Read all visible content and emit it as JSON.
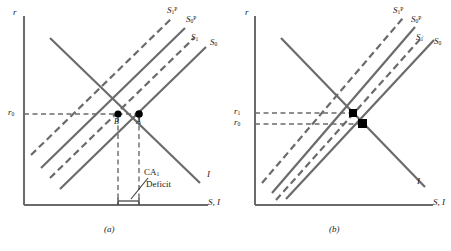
{
  "figure": {
    "type": "economics-diagram"
  },
  "panels": [
    {
      "id": "a",
      "caption": "(a)",
      "axes": {
        "y_label": "r",
        "x_label": "S, I"
      },
      "y_ticks": [
        {
          "label": "r",
          "sub": "0"
        }
      ],
      "curves": [
        {
          "name": "S1P",
          "label_base": "S",
          "label_sub": "1",
          "label_sup": "P",
          "style": "dashed",
          "slope": "up"
        },
        {
          "name": "S0P",
          "label_base": "S",
          "label_sub": "0",
          "label_sup": "P",
          "style": "solid",
          "slope": "up"
        },
        {
          "name": "S1",
          "label_base": "S",
          "label_sub": "1",
          "label_sup": "",
          "style": "dashed",
          "slope": "up"
        },
        {
          "name": "S0",
          "label_base": "S",
          "label_sub": "0",
          "label_sup": "",
          "style": "solid",
          "slope": "up"
        },
        {
          "name": "I",
          "label_base": "I",
          "label_sub": "",
          "label_sup": "",
          "style": "solid",
          "slope": "down"
        }
      ],
      "points": [
        {
          "label": "B",
          "position": "left"
        },
        {
          "label": "A",
          "position": "right"
        }
      ],
      "annotations": [
        {
          "line1_base": "CA",
          "line1_sub": "1",
          "line2": "Deficit"
        }
      ]
    },
    {
      "id": "b",
      "caption": "(b)",
      "axes": {
        "y_label": "r",
        "x_label": "S, I"
      },
      "y_ticks": [
        {
          "label": "r",
          "sub": "1"
        },
        {
          "label": "r",
          "sub": "0"
        }
      ],
      "curves": [
        {
          "name": "S1P",
          "label_base": "S",
          "label_sub": "1",
          "label_sup": "P",
          "style": "dashed",
          "slope": "up"
        },
        {
          "name": "S0P",
          "label_base": "S",
          "label_sub": "0",
          "label_sup": "P",
          "style": "solid",
          "slope": "up"
        },
        {
          "name": "S1",
          "label_base": "S",
          "label_sub": "1",
          "label_sup": "",
          "style": "dashed",
          "slope": "up"
        },
        {
          "name": "S0",
          "label_base": "S",
          "label_sub": "0",
          "label_sup": "",
          "style": "solid",
          "slope": "up"
        },
        {
          "name": "I",
          "label_base": "I",
          "label_sub": "",
          "label_sup": "",
          "style": "solid",
          "slope": "down"
        }
      ],
      "points": [],
      "annotations": []
    }
  ],
  "colors": {
    "curve": "#6b6b6b",
    "axis": "#6b6b6b",
    "dashed": "#6b6b6b",
    "text": "#1a1a1a",
    "point": "#000000"
  }
}
